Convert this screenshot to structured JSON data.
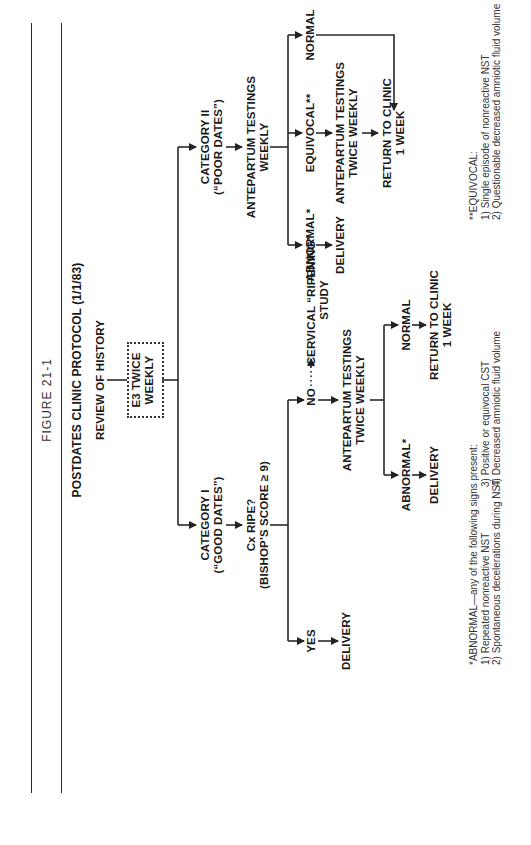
{
  "figure_label": "FIGURE 21-1",
  "title": "POSTDATES CLINIC PROTOCOL (1/1/83)",
  "nodes": {
    "review": "REVIEW OF HISTORY",
    "e3": [
      "E3 TWICE",
      "WEEKLY"
    ],
    "cat1": [
      "CATEGORY I",
      "(“GOOD DATES”)"
    ],
    "cx_ripe": [
      "Cx RIPE?",
      "(BISHOP’S SCORE ≥ 9)"
    ],
    "yes": "YES",
    "yes_delivery": "DELIVERY",
    "no": "NO",
    "ripening": [
      "CERVICAL “RIPENING”",
      "STUDY"
    ],
    "c1_antepartum": [
      "ANTEPARTUM TESTINGS",
      "TWICE WEEKLY"
    ],
    "c1_abnormal": "ABNORMAL*",
    "c1_delivery": "DELIVERY",
    "c1_normal": "NORMAL",
    "c1_return": [
      "RETURN TO CLINIC",
      "1 WEEK"
    ],
    "cat2": [
      "CATEGORY II",
      "(“POOR DATES”)"
    ],
    "c2_antepartum": [
      "ANTEPARTUM TESTINGS",
      "WEEKLY"
    ],
    "c2_abnormal": "ABNORMAL*",
    "c2_delivery": "DELIVERY",
    "c2_equivocal": "EQUIVOCAL**",
    "c2_antepartum2": [
      "ANTEPARTUM TESTINGS",
      "TWICE WEEKLY"
    ],
    "c2_normal": "NORMAL",
    "c2_return": [
      "RETURN TO CLINIC",
      "1 WEEK"
    ]
  },
  "footnotes": {
    "abnormal": {
      "heading": "*ABNORMAL—any of the following signs present:",
      "items": [
        "1)  Repeated nonreactive NST",
        "2)  Spontaneous decelerations during NST",
        "3)  Positive or equivocal CST",
        "4)  Decreased amniotic fluid volume"
      ]
    },
    "equivocal": {
      "heading": "**EQUIVOCAL:",
      "items": [
        "1)  Single episode of nonreactive NST",
        "2)  Questionable decreased amniotic  fluid volume"
      ]
    }
  }
}
